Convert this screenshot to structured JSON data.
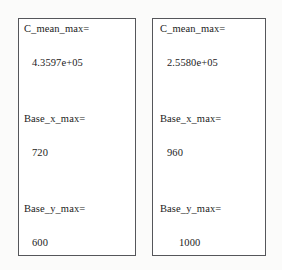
{
  "panels": [
    {
      "name": "left-panel",
      "fields": [
        {
          "label": "C_mean_max=",
          "value": "4.3597e+05"
        },
        {
          "label": "Base_x_max=",
          "value": "720"
        },
        {
          "label": "Base_y_max=",
          "value": "600"
        }
      ]
    },
    {
      "name": "right-panel",
      "fields": [
        {
          "label": "C_mean_max=",
          "value": "2.5580e+05"
        },
        {
          "label": "Base_x_max=",
          "value": "960"
        },
        {
          "label": "Base_y_max=",
          "value": "1000"
        }
      ]
    }
  ],
  "colors": {
    "page_background": "#fbfbfa",
    "panel_background": "#ffffff",
    "panel_border": "#55565a",
    "text": "#1b1b1b"
  }
}
